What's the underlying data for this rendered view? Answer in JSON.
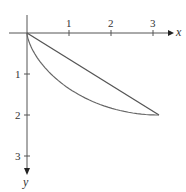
{
  "chart_data": {
    "type": "line",
    "title": "",
    "xlabel": "x",
    "ylabel": "y",
    "x_ticks": [
      "1",
      "2",
      "3"
    ],
    "y_ticks": [
      "1",
      "2",
      "3"
    ],
    "y_axis_inverted": true,
    "xlim": [
      0,
      3.3
    ],
    "ylim": [
      0,
      3.3
    ],
    "grid": false,
    "series": [
      {
        "name": "straight line",
        "x": [
          0,
          3.14159
        ],
        "y": [
          0,
          2
        ]
      },
      {
        "name": "cycloid",
        "x": [
          0,
          0.02,
          0.14,
          0.43,
          0.93,
          1.57,
          2.21,
          2.71,
          3.0,
          3.12,
          3.14159
        ],
        "y": [
          0,
          0.12,
          0.44,
          0.89,
          1.38,
          1.71,
          1.93,
          1.99,
          2.0,
          2.0,
          2.0
        ]
      }
    ]
  }
}
